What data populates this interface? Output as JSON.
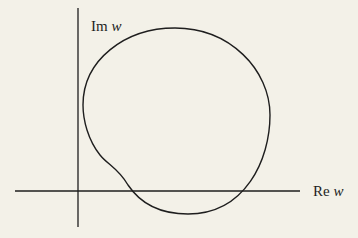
{
  "diagram": {
    "type": "complex-plane contour",
    "axes": {
      "horizontal_label": {
        "prefix": "Re",
        "var": "w"
      },
      "vertical_label": {
        "prefix": "Im",
        "var": "w"
      }
    },
    "curve": "closed contour in w-plane encircling region, with an indentation near the origin",
    "colors": {
      "background": "#f3f1e8",
      "ink": "#1e1e1e"
    }
  }
}
